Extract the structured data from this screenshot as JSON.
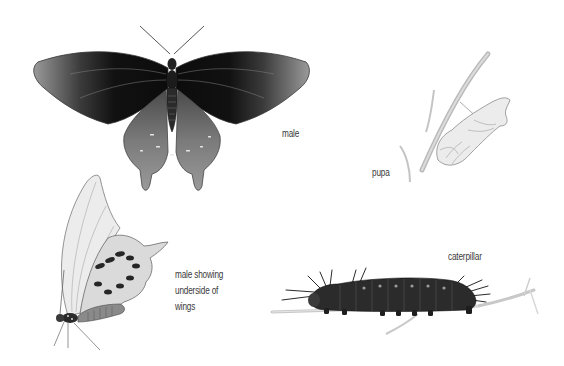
{
  "illustration": {
    "subject": "swallowtail butterfly life stages",
    "colors": {
      "background": "#ffffff",
      "wing_dark": "#151515",
      "wing_mid": "#6e6e6e",
      "wing_light": "#c9c9c9",
      "sketch_line": "#9a9a9a",
      "label_text": "#3a3a3a"
    }
  },
  "figures": {
    "male": {
      "label": "male"
    },
    "pupa": {
      "label": "pupa"
    },
    "male_underside": {
      "label_lines": [
        "male showing",
        "underside of",
        "wings"
      ]
    },
    "caterpillar": {
      "label": "caterpillar"
    }
  }
}
